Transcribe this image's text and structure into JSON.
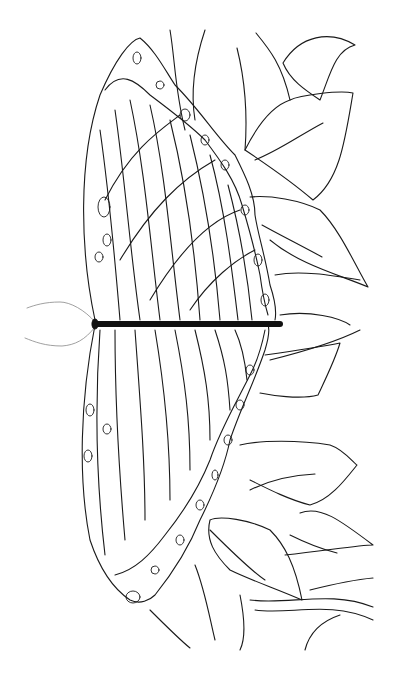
{
  "image": {
    "subject": "butterfly coloring page with leaves",
    "colors": {
      "background": "#ffffff",
      "line": "#1a1a1a",
      "body": "#111111",
      "antenna": "#888888"
    }
  }
}
